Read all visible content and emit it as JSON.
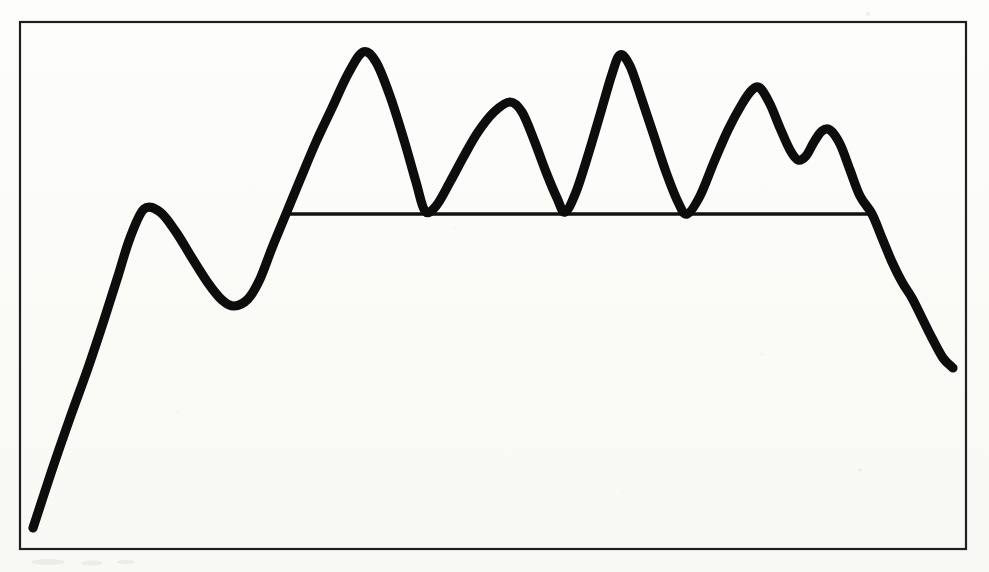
{
  "figure": {
    "background_color": "#fcfcfa",
    "ink_color": "#0d0d0d",
    "frame_color": "#1f1f1f",
    "frame": {
      "x": 20,
      "y": 22,
      "width": 946,
      "height": 527
    },
    "stroke_width_signal": 9.2,
    "stroke_width_threshold": 3.4,
    "stroke_width_frame": 2.2
  },
  "chart_data": {
    "type": "line",
    "title": "",
    "subtitle": "",
    "xlabel": "",
    "ylabel": "",
    "xlim": [
      20,
      966
    ],
    "ylim": [
      549,
      22
    ],
    "grid": false,
    "legend": "none",
    "axis_ticks": "none",
    "tick_labels": [],
    "annotations": [],
    "series": [
      {
        "name": "signal-trace",
        "style": "thick-black-curve",
        "color": "#0d0d0d",
        "points": [
          [
            33,
            528
          ],
          [
            52,
            470
          ],
          [
            70,
            418
          ],
          [
            88,
            368
          ],
          [
            104,
            320
          ],
          [
            118,
            276
          ],
          [
            130,
            238
          ],
          [
            144,
            209
          ],
          [
            160,
            212
          ],
          [
            176,
            232
          ],
          [
            192,
            258
          ],
          [
            208,
            283
          ],
          [
            222,
            300
          ],
          [
            234,
            306
          ],
          [
            248,
            299
          ],
          [
            260,
            279
          ],
          [
            272,
            248
          ],
          [
            286,
            214
          ],
          [
            300,
            180
          ],
          [
            316,
            142
          ],
          [
            332,
            108
          ],
          [
            348,
            74
          ],
          [
            363,
            52
          ],
          [
            376,
            62
          ],
          [
            390,
            96
          ],
          [
            404,
            140
          ],
          [
            416,
            182
          ],
          [
            425,
            211
          ],
          [
            436,
            206
          ],
          [
            450,
            182
          ],
          [
            464,
            156
          ],
          [
            478,
            132
          ],
          [
            494,
            112
          ],
          [
            510,
            102
          ],
          [
            522,
            112
          ],
          [
            534,
            140
          ],
          [
            546,
            172
          ],
          [
            557,
            198
          ],
          [
            565,
            212
          ],
          [
            576,
            192
          ],
          [
            589,
            152
          ],
          [
            602,
            108
          ],
          [
            612,
            74
          ],
          [
            620,
            55
          ],
          [
            630,
            66
          ],
          [
            642,
            100
          ],
          [
            654,
            136
          ],
          [
            666,
            172
          ],
          [
            678,
            202
          ],
          [
            687,
            214
          ],
          [
            700,
            196
          ],
          [
            714,
            162
          ],
          [
            728,
            130
          ],
          [
            742,
            104
          ],
          [
            752,
            90
          ],
          [
            760,
            88
          ],
          [
            770,
            104
          ],
          [
            780,
            128
          ],
          [
            790,
            150
          ],
          [
            798,
            160
          ],
          [
            806,
            156
          ],
          [
            814,
            142
          ],
          [
            822,
            131
          ],
          [
            830,
            130
          ],
          [
            840,
            144
          ],
          [
            850,
            170
          ],
          [
            860,
            196
          ],
          [
            872,
            214
          ],
          [
            882,
            238
          ],
          [
            892,
            262
          ],
          [
            902,
            282
          ],
          [
            912,
            298
          ],
          [
            922,
            318
          ],
          [
            932,
            338
          ],
          [
            943,
            358
          ],
          [
            953,
            368
          ]
        ]
      }
    ],
    "reference_lines": [
      {
        "name": "threshold-baseline",
        "orientation": "horizontal",
        "y": 214,
        "x_start": 286,
        "x_end": 874,
        "color": "#121212"
      }
    ],
    "peaks": [
      {
        "index": 1,
        "x": 144,
        "y": 209,
        "label": ""
      },
      {
        "index": 2,
        "x": 363,
        "y": 52,
        "label": ""
      },
      {
        "index": 3,
        "x": 510,
        "y": 102,
        "label": ""
      },
      {
        "index": 4,
        "x": 620,
        "y": 55,
        "label": ""
      },
      {
        "index": 5,
        "x": 760,
        "y": 88,
        "label": ""
      },
      {
        "index": 6,
        "x": 830,
        "y": 130,
        "label": ""
      }
    ],
    "valleys": [
      {
        "index": 1,
        "x": 234,
        "y": 306
      },
      {
        "index": 2,
        "x": 425,
        "y": 211
      },
      {
        "index": 3,
        "x": 565,
        "y": 212
      },
      {
        "index": 4,
        "x": 687,
        "y": 214
      },
      {
        "index": 5,
        "x": 798,
        "y": 160
      }
    ]
  }
}
